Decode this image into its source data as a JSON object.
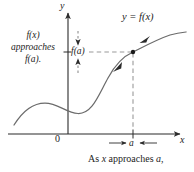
{
  "figure": {
    "axes": {
      "y_label": "y",
      "x_label": "x",
      "origin_label": "0"
    },
    "labels": {
      "curve_equation": "y = f(x)",
      "y_value_tick": "f(a)",
      "x_value_tick": "a"
    },
    "left_caption": {
      "line1": "f(x)",
      "line2": "approaches",
      "line3": "f(a)."
    },
    "bottom_caption": {
      "prefix": "As ",
      "variable_x": "x",
      "middle": " approaches ",
      "variable_a": "a",
      "suffix": ","
    },
    "colors": {
      "background": "#ffffff",
      "curve": "#6b6b6b",
      "axis": "#2b2b2b",
      "dashed": "#9a9a9a",
      "text": "#242424",
      "point": "#1a1a1a"
    },
    "geometry": {
      "y_axis_x": 68,
      "x_axis_y": 134,
      "point_x": 133,
      "point_y": 52
    }
  }
}
